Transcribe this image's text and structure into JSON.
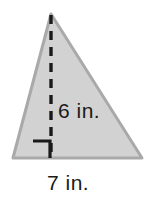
{
  "figure": {
    "name": "triangle-with-height",
    "type": "geometry-diagram",
    "shape": "triangle",
    "fill_color": "#d2d2d2",
    "stroke_color": "#a8a8a8",
    "line_color": "#1a1a1a",
    "background_color": "#ffffff",
    "vertices": {
      "apex": [
        51,
        14
      ],
      "bottom_left": [
        13,
        158
      ],
      "bottom_right": [
        142,
        158
      ]
    },
    "height_segment": {
      "name": "height-dashed-line",
      "from": [
        51,
        14
      ],
      "to": [
        51,
        158
      ],
      "style": "dashed"
    },
    "right_angle_marker": {
      "name": "right-angle-square",
      "corner": [
        51,
        158
      ],
      "size": 17
    }
  },
  "labels": {
    "height": "6 in.",
    "base": "7 in."
  },
  "measurements": {
    "height_value": 6,
    "height_unit": "in.",
    "base_value": 7,
    "base_unit": "in."
  }
}
